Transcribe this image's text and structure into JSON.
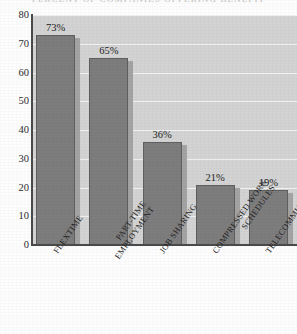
{
  "chart_data": {
    "type": "bar",
    "title": "",
    "title_sliver": "PERCENT OF COMPANIES OFFERING BENEFIT",
    "categories": [
      "FLEXTIME",
      "PART-TIME EMPLOYMENT",
      "JOB SHARING",
      "COMPRESSED WORK SCHEDULES",
      "TELECOMMUTING"
    ],
    "category_lines": [
      [
        "FLEXTIME"
      ],
      [
        "PART-TIME",
        "EMPLOYMENT"
      ],
      [
        "JOB SHARING"
      ],
      [
        "COMPRESSED WORK",
        "SCHEDULES"
      ],
      [
        "TELECOMMUTING"
      ]
    ],
    "values": [
      73,
      65,
      36,
      21,
      19
    ],
    "data_labels": [
      "73%",
      "65%",
      "36%",
      "21%",
      "19%"
    ],
    "xlabel": "",
    "ylabel": "",
    "ylim": [
      0,
      80
    ],
    "yticks": [
      80,
      70,
      60,
      50,
      40,
      30,
      20,
      10,
      0
    ],
    "ytick_labels": [
      "80",
      "70",
      "60",
      "50",
      "40",
      "30",
      "20",
      "10",
      "0"
    ],
    "grid": true,
    "grid_orientation": "horizontal",
    "legend": false,
    "legend_position": "none",
    "colors": {
      "bar_fill": "#7e7d7e",
      "bar_border": "#5f5f5f",
      "bar_shadow": "#a3a3a3",
      "plot_background": "#d3d3d3",
      "gridline": "#f2f2f2",
      "axis": "#4a4a4a",
      "text": "#1d1d1d",
      "page_background": "#fdfdfd"
    }
  }
}
